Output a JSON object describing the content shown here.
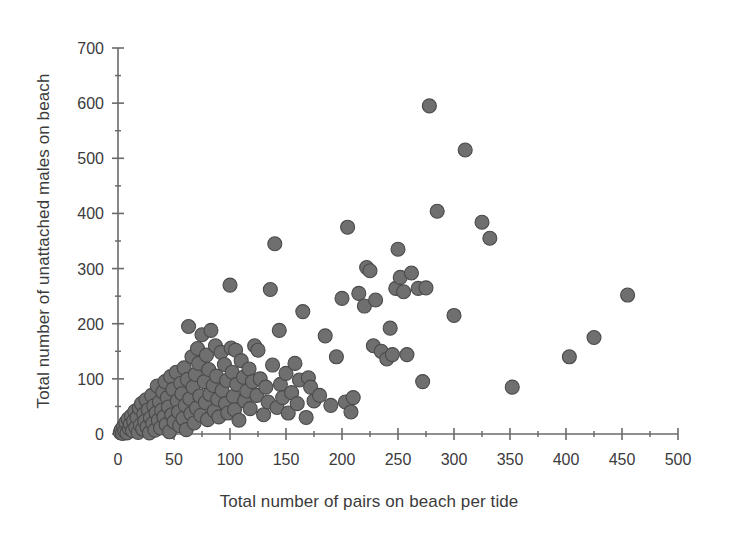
{
  "chart_data": {
    "type": "scatter",
    "title": "",
    "xlabel": "Total number of pairs on beach per tide",
    "ylabel": "Total number of unattached males on beach",
    "xlim": [
      0,
      500
    ],
    "ylim": [
      0,
      700
    ],
    "x_major_ticks": [
      0,
      50,
      100,
      150,
      200,
      250,
      300,
      350,
      400,
      450,
      500
    ],
    "x_minor_ticks": [
      25,
      75,
      125,
      175,
      225,
      275,
      325,
      375,
      425,
      475
    ],
    "y_major_ticks": [
      0,
      100,
      200,
      300,
      400,
      500,
      600,
      700
    ],
    "y_minor_ticks": [
      50,
      150,
      250,
      350,
      450,
      550,
      650
    ],
    "x_tick_labels": [
      "0",
      "50",
      "100",
      "150",
      "200",
      "250",
      "300",
      "350",
      "400",
      "450",
      "500"
    ],
    "y_tick_labels": [
      "0",
      "100",
      "200",
      "300",
      "400",
      "500",
      "600",
      "700"
    ],
    "grid": false,
    "legend": false,
    "marker": {
      "shape": "circle",
      "fill_color": "#6f6f6f",
      "edge_color": "#4a4a4a",
      "size_px": 14
    },
    "axis_color": "#6a6a6a",
    "series": [
      {
        "name": "Beach counts",
        "points": [
          [
            2,
            3
          ],
          [
            3,
            8
          ],
          [
            4,
            1
          ],
          [
            5,
            14
          ],
          [
            6,
            5
          ],
          [
            7,
            21
          ],
          [
            8,
            2
          ],
          [
            9,
            27
          ],
          [
            10,
            10
          ],
          [
            11,
            18
          ],
          [
            12,
            33
          ],
          [
            13,
            6
          ],
          [
            14,
            24
          ],
          [
            15,
            41
          ],
          [
            16,
            12
          ],
          [
            17,
            30
          ],
          [
            18,
            3
          ],
          [
            19,
            47
          ],
          [
            20,
            16
          ],
          [
            21,
            55
          ],
          [
            22,
            9
          ],
          [
            23,
            36
          ],
          [
            24,
            23
          ],
          [
            25,
            62
          ],
          [
            26,
            13
          ],
          [
            27,
            44
          ],
          [
            28,
            2
          ],
          [
            29,
            29
          ],
          [
            30,
            70
          ],
          [
            31,
            19
          ],
          [
            32,
            51
          ],
          [
            33,
            7
          ],
          [
            34,
            38
          ],
          [
            35,
            87
          ],
          [
            36,
            25
          ],
          [
            37,
            58
          ],
          [
            38,
            11
          ],
          [
            39,
            43
          ],
          [
            40,
            76
          ],
          [
            41,
            31
          ],
          [
            42,
            95
          ],
          [
            43,
            17
          ],
          [
            44,
            66
          ],
          [
            45,
            49
          ],
          [
            46,
            4
          ],
          [
            47,
            104
          ],
          [
            48,
            35
          ],
          [
            49,
            81
          ],
          [
            50,
            22
          ],
          [
            52,
            112
          ],
          [
            53,
            60
          ],
          [
            54,
            40
          ],
          [
            55,
            15
          ],
          [
            56,
            92
          ],
          [
            57,
            73
          ],
          [
            58,
            28
          ],
          [
            59,
            120
          ],
          [
            60,
            52
          ],
          [
            61,
            8
          ],
          [
            62,
            99
          ],
          [
            63,
            195
          ],
          [
            64,
            64
          ],
          [
            65,
            37
          ],
          [
            66,
            140
          ],
          [
            67,
            85
          ],
          [
            68,
            20
          ],
          [
            69,
            108
          ],
          [
            70,
            47
          ],
          [
            71,
            155
          ],
          [
            72,
            128
          ],
          [
            73,
            69
          ],
          [
            74,
            34
          ],
          [
            75,
            180
          ],
          [
            77,
            95
          ],
          [
            78,
            57
          ],
          [
            79,
            143
          ],
          [
            80,
            26
          ],
          [
            81,
            117
          ],
          [
            82,
            72
          ],
          [
            83,
            188
          ],
          [
            85,
            88
          ],
          [
            86,
            42
          ],
          [
            87,
            160
          ],
          [
            88,
            105
          ],
          [
            89,
            63
          ],
          [
            90,
            31
          ],
          [
            92,
            148
          ],
          [
            93,
            79
          ],
          [
            95,
            126
          ],
          [
            96,
            55
          ],
          [
            97,
            97
          ],
          [
            98,
            38
          ],
          [
            100,
            270
          ],
          [
            101,
            156
          ],
          [
            102,
            112
          ],
          [
            103,
            68
          ],
          [
            104,
            44
          ],
          [
            105,
            152
          ],
          [
            106,
            90
          ],
          [
            108,
            25
          ],
          [
            110,
            133
          ],
          [
            112,
            103
          ],
          [
            113,
            60
          ],
          [
            115,
            78
          ],
          [
            117,
            118
          ],
          [
            118,
            46
          ],
          [
            120,
            95
          ],
          [
            122,
            160
          ],
          [
            124,
            70
          ],
          [
            125,
            152
          ],
          [
            127,
            100
          ],
          [
            130,
            35
          ],
          [
            132,
            85
          ],
          [
            134,
            58
          ],
          [
            136,
            262
          ],
          [
            138,
            125
          ],
          [
            140,
            345
          ],
          [
            142,
            48
          ],
          [
            144,
            188
          ],
          [
            145,
            90
          ],
          [
            147,
            66
          ],
          [
            150,
            110
          ],
          [
            152,
            38
          ],
          [
            155,
            75
          ],
          [
            158,
            128
          ],
          [
            160,
            55
          ],
          [
            162,
            98
          ],
          [
            165,
            222
          ],
          [
            168,
            30
          ],
          [
            170,
            102
          ],
          [
            172,
            85
          ],
          [
            175,
            60
          ],
          [
            180,
            70
          ],
          [
            185,
            178
          ],
          [
            190,
            52
          ],
          [
            195,
            140
          ],
          [
            200,
            246
          ],
          [
            203,
            58
          ],
          [
            205,
            375
          ],
          [
            208,
            40
          ],
          [
            210,
            66
          ],
          [
            215,
            255
          ],
          [
            220,
            232
          ],
          [
            222,
            302
          ],
          [
            225,
            296
          ],
          [
            228,
            160
          ],
          [
            230,
            243
          ],
          [
            235,
            150
          ],
          [
            240,
            136
          ],
          [
            243,
            192
          ],
          [
            245,
            144
          ],
          [
            248,
            264
          ],
          [
            250,
            335
          ],
          [
            252,
            284
          ],
          [
            255,
            258
          ],
          [
            258,
            144
          ],
          [
            262,
            292
          ],
          [
            268,
            264
          ],
          [
            272,
            95
          ],
          [
            275,
            265
          ],
          [
            278,
            595
          ],
          [
            285,
            404
          ],
          [
            300,
            215
          ],
          [
            310,
            515
          ],
          [
            325,
            384
          ],
          [
            332,
            355
          ],
          [
            352,
            85
          ],
          [
            403,
            140
          ],
          [
            425,
            175
          ],
          [
            455,
            252
          ]
        ]
      }
    ]
  },
  "axes": {
    "x_title": "Total number of pairs on beach per tide",
    "y_title": "Total number of unattached males on beach"
  }
}
